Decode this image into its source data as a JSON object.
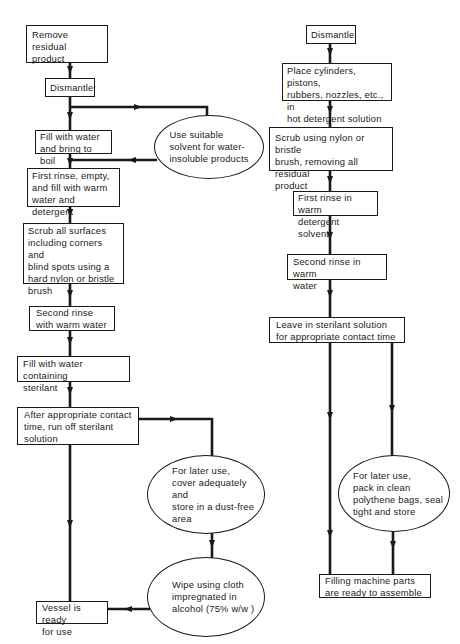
{
  "diagram": {
    "type": "flowchart",
    "left_flow": {
      "steps": [
        {
          "id": "l1",
          "label": "Remove residual\nproduct"
        },
        {
          "id": "l2",
          "label": "Dismantle"
        },
        {
          "id": "l3",
          "label": "Fill with water\nand bring to boil"
        },
        {
          "id": "l3b",
          "label": "Use suitable\nsolvent for water-\ninsoluble products",
          "shape": "ellipse"
        },
        {
          "id": "l4",
          "label": "First rinse, empty,\nand fill with warm\nwater and detergent"
        },
        {
          "id": "l5",
          "label": "Scrub all surfaces\nincluding corners and\nblind spots using a\nhard nylon or bristle\nbrush"
        },
        {
          "id": "l6",
          "label": "Second rinse\nwith warm water"
        },
        {
          "id": "l7",
          "label": "Fill with water containing\nsterilant"
        },
        {
          "id": "l8",
          "label": "After appropriate contact\ntime, run off sterilant\nsolution"
        },
        {
          "id": "l9",
          "label": "For later use,\ncover adequately and\nstore in a dust-free\narea",
          "shape": "ellipse"
        },
        {
          "id": "l10",
          "label": "Wipe using cloth\nimpregnated in\nalcohol (75% w/w )",
          "shape": "ellipse"
        },
        {
          "id": "l11",
          "label": "Vessel is ready\nfor use"
        }
      ],
      "edges": [
        [
          "l1",
          "l2"
        ],
        [
          "l2",
          "l3"
        ],
        [
          "l2",
          "l3b"
        ],
        [
          "l3",
          "l4"
        ],
        [
          "l3b",
          "l4"
        ],
        [
          "l4",
          "l5"
        ],
        [
          "l5",
          "l6"
        ],
        [
          "l6",
          "l7"
        ],
        [
          "l7",
          "l8"
        ],
        [
          "l8",
          "l9"
        ],
        [
          "l8",
          "l11"
        ],
        [
          "l9",
          "l10"
        ],
        [
          "l10",
          "l11"
        ]
      ]
    },
    "right_flow": {
      "steps": [
        {
          "id": "r1",
          "label": "Dismantle"
        },
        {
          "id": "r2",
          "label": "Place cylinders, pistons,\nrubbers, nozzles, etc., in\nhot detergent solution"
        },
        {
          "id": "r3",
          "label": "Scrub using nylon or bristle\nbrush, removing all residual\nproduct"
        },
        {
          "id": "r4",
          "label": "First rinse in warm\ndetergent solvent"
        },
        {
          "id": "r5",
          "label": "Second rinse in warm\nwater"
        },
        {
          "id": "r6",
          "label": "Leave in sterilant solution\nfor appropriate contact time"
        },
        {
          "id": "r7",
          "label": "For later use,\npack in clean\npolythene bags, seal\ntight and store",
          "shape": "ellipse"
        },
        {
          "id": "r8",
          "label": "Filling machine parts\nare ready to assemble"
        }
      ],
      "edges": [
        [
          "r1",
          "r2"
        ],
        [
          "r2",
          "r3"
        ],
        [
          "r3",
          "r4"
        ],
        [
          "r4",
          "r5"
        ],
        [
          "r5",
          "r6"
        ],
        [
          "r6",
          "r7"
        ],
        [
          "r6",
          "r8"
        ],
        [
          "r7",
          "r8"
        ]
      ]
    },
    "colors": {
      "line": "#1a1a1a",
      "background": "#ffffff"
    }
  }
}
